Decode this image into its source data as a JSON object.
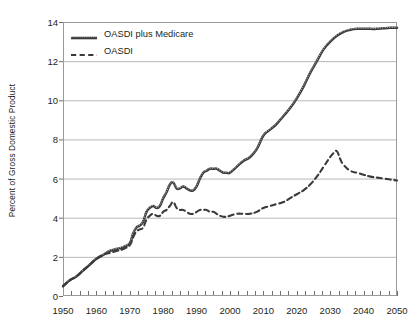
{
  "chart_data": {
    "type": "line",
    "title": "",
    "xlabel": "",
    "ylabel": "Percent of Gross Domestic Product",
    "xlim": [
      1950,
      2050
    ],
    "ylim": [
      0,
      14
    ],
    "yticks": [
      0,
      2,
      4,
      6,
      8,
      10,
      12,
      14
    ],
    "xticks": [
      1950,
      1960,
      1970,
      1980,
      1990,
      2000,
      2010,
      2020,
      2030,
      2040,
      2050
    ],
    "xtick_labels": [
      "1950",
      "1960",
      "1970",
      "1980",
      "1990",
      "2000",
      "2010",
      "2020",
      "2030",
      "2040",
      "2050"
    ],
    "ytick_labels": [
      "0",
      "2",
      "4",
      "6",
      "8",
      "10",
      "12",
      "14"
    ],
    "minor_xtick_interval": 2.5,
    "grid": "horizontal",
    "legend_position": "top-left",
    "series": [
      {
        "name": "OASDI plus Medicare",
        "style": "solid",
        "color": "#3a3a3a",
        "x": [
          1950,
          1952,
          1954,
          1956,
          1958,
          1960,
          1962,
          1964,
          1966,
          1968,
          1970,
          1971,
          1972,
          1973,
          1974,
          1975,
          1976,
          1977,
          1978,
          1979,
          1980,
          1981,
          1982,
          1983,
          1984,
          1985,
          1986,
          1987,
          1988,
          1989,
          1990,
          1991,
          1992,
          1993,
          1994,
          1995,
          1996,
          1997,
          1998,
          1999,
          2000,
          2002,
          2004,
          2006,
          2008,
          2010,
          2012,
          2014,
          2016,
          2018,
          2020,
          2022,
          2024,
          2026,
          2028,
          2030,
          2032,
          2034,
          2036,
          2038,
          2040,
          2042,
          2044,
          2046,
          2048,
          2050
        ],
        "y": [
          0.5,
          0.8,
          1.0,
          1.3,
          1.6,
          1.9,
          2.1,
          2.3,
          2.4,
          2.5,
          2.7,
          3.2,
          3.5,
          3.6,
          3.8,
          4.3,
          4.5,
          4.6,
          4.5,
          4.6,
          5.0,
          5.3,
          5.7,
          5.8,
          5.5,
          5.5,
          5.6,
          5.5,
          5.4,
          5.4,
          5.6,
          6.0,
          6.3,
          6.4,
          6.5,
          6.5,
          6.5,
          6.4,
          6.3,
          6.3,
          6.3,
          6.6,
          6.9,
          7.1,
          7.5,
          8.2,
          8.5,
          8.8,
          9.2,
          9.6,
          10.1,
          10.7,
          11.4,
          12.0,
          12.6,
          13.0,
          13.3,
          13.5,
          13.6,
          13.65,
          13.65,
          13.65,
          13.65,
          13.68,
          13.7,
          13.7
        ]
      },
      {
        "name": "OASDI",
        "style": "dashed",
        "color": "#3a3a3a",
        "x": [
          1950,
          1952,
          1954,
          1956,
          1958,
          1960,
          1962,
          1964,
          1966,
          1968,
          1970,
          1971,
          1972,
          1973,
          1974,
          1975,
          1976,
          1977,
          1978,
          1979,
          1980,
          1981,
          1982,
          1983,
          1984,
          1985,
          1986,
          1987,
          1988,
          1989,
          1990,
          1991,
          1992,
          1993,
          1994,
          1995,
          1996,
          1997,
          1998,
          1999,
          2000,
          2002,
          2004,
          2006,
          2008,
          2010,
          2012,
          2014,
          2016,
          2018,
          2020,
          2022,
          2024,
          2026,
          2028,
          2030,
          2031,
          2032,
          2033,
          2034,
          2036,
          2038,
          2040,
          2042,
          2044,
          2046,
          2048,
          2050
        ],
        "y": [
          0.5,
          0.8,
          1.0,
          1.3,
          1.6,
          1.9,
          2.1,
          2.2,
          2.3,
          2.4,
          2.6,
          3.0,
          3.3,
          3.4,
          3.5,
          3.9,
          4.1,
          4.2,
          4.1,
          4.1,
          4.3,
          4.4,
          4.6,
          4.8,
          4.5,
          4.4,
          4.4,
          4.3,
          4.2,
          4.2,
          4.3,
          4.4,
          4.4,
          4.4,
          4.3,
          4.3,
          4.2,
          4.1,
          4.05,
          4.05,
          4.1,
          4.2,
          4.2,
          4.2,
          4.3,
          4.5,
          4.6,
          4.7,
          4.8,
          5.0,
          5.2,
          5.4,
          5.7,
          6.1,
          6.6,
          7.1,
          7.3,
          7.4,
          7.0,
          6.7,
          6.4,
          6.3,
          6.2,
          6.1,
          6.05,
          6.0,
          5.95,
          5.9
        ]
      }
    ]
  },
  "legend": {
    "items": [
      {
        "label": "OASDI plus Medicare",
        "style": "solid"
      },
      {
        "label": "OASDI",
        "style": "dashed"
      }
    ]
  }
}
